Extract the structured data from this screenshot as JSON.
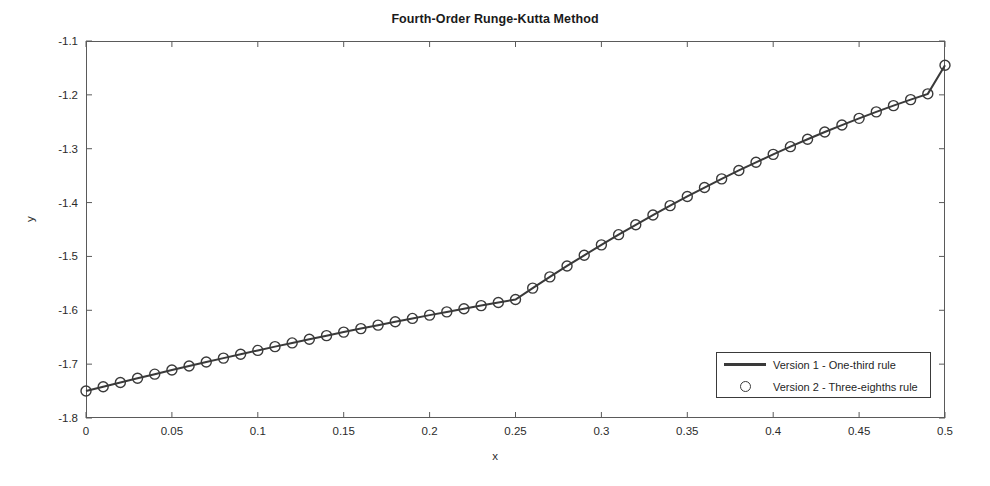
{
  "chart_data": {
    "type": "line",
    "title": "Fourth-Order Runge-Kutta Method",
    "xlabel": "x",
    "ylabel": "y",
    "xlim": [
      0,
      0.5
    ],
    "ylim": [
      -1.8,
      -1.1
    ],
    "grid": false,
    "legend_position": "lower right",
    "xticks": [
      "0",
      "0.05",
      "0.1",
      "0.15",
      "0.2",
      "0.25",
      "0.3",
      "0.35",
      "0.4",
      "0.45",
      "0.5"
    ],
    "xtick_values": [
      0,
      0.05,
      0.1,
      0.15,
      0.2,
      0.25,
      0.3,
      0.35,
      0.4,
      0.45,
      0.5
    ],
    "yticks": [
      "-1.1",
      "-1.2",
      "-1.3",
      "-1.4",
      "-1.5",
      "-1.6",
      "-1.7",
      "-1.8"
    ],
    "ytick_values": [
      -1.1,
      -1.2,
      -1.3,
      -1.4,
      -1.5,
      -1.6,
      -1.7,
      -1.8
    ],
    "x": [
      0,
      0.01,
      0.02,
      0.03,
      0.04,
      0.05,
      0.06,
      0.07,
      0.08,
      0.09,
      0.1,
      0.11,
      0.12,
      0.13,
      0.14,
      0.15,
      0.16,
      0.17,
      0.18,
      0.19,
      0.2,
      0.21,
      0.22,
      0.23,
      0.24,
      0.25,
      0.26,
      0.27,
      0.28,
      0.29,
      0.3,
      0.31,
      0.32,
      0.33,
      0.34,
      0.35,
      0.36,
      0.37,
      0.38,
      0.39,
      0.4,
      0.41,
      0.42,
      0.43,
      0.44,
      0.45,
      0.46,
      0.47,
      0.48,
      0.49,
      0.5
    ],
    "series": [
      {
        "name": "Version 1 - One-third rule",
        "style": "line",
        "color": "#3a3a3a",
        "values": [
          -1.75,
          -1.742,
          -1.7341,
          -1.7263,
          -1.7186,
          -1.711,
          -1.7035,
          -1.6961,
          -1.6888,
          -1.6816,
          -1.6745,
          -1.6675,
          -1.6606,
          -1.6538,
          -1.6471,
          -1.6405,
          -1.634,
          -1.6276,
          -1.6213,
          -1.6151,
          -1.609,
          -1.603,
          -1.5971,
          -1.5913,
          -1.5856,
          -1.58,
          -1.5588,
          -1.538,
          -1.5177,
          -1.4979,
          -1.4785,
          -1.4596,
          -1.4412,
          -1.4232,
          -1.4057,
          -1.3887,
          -1.3721,
          -1.356,
          -1.3404,
          -1.3252,
          -1.3105,
          -1.2962,
          -1.2824,
          -1.269,
          -1.2561,
          -1.2436,
          -1.2316,
          -1.22,
          -1.2088,
          -1.1981,
          -1.145
        ]
      },
      {
        "name": "Version 2 - Three-eighths rule",
        "style": "marker",
        "marker": "circle",
        "color": "#3a3a3a",
        "values": [
          -1.75,
          -1.742,
          -1.7341,
          -1.7263,
          -1.7186,
          -1.711,
          -1.7035,
          -1.6961,
          -1.6888,
          -1.6816,
          -1.6745,
          -1.6675,
          -1.6606,
          -1.6538,
          -1.6471,
          -1.6405,
          -1.634,
          -1.6276,
          -1.6213,
          -1.6151,
          -1.609,
          -1.603,
          -1.5971,
          -1.5913,
          -1.5856,
          -1.58,
          -1.5588,
          -1.538,
          -1.5177,
          -1.4979,
          -1.4785,
          -1.4596,
          -1.4412,
          -1.4232,
          -1.4057,
          -1.3887,
          -1.3721,
          -1.356,
          -1.3404,
          -1.3252,
          -1.3105,
          -1.2962,
          -1.2824,
          -1.269,
          -1.2561,
          -1.2436,
          -1.2316,
          -1.22,
          -1.2088,
          -1.1981,
          -1.145
        ]
      }
    ],
    "legend": [
      {
        "label": "Version 1 - One-third rule",
        "marker": "line"
      },
      {
        "label": "Version 2 - Three-eighths rule",
        "marker": "circle"
      }
    ]
  }
}
